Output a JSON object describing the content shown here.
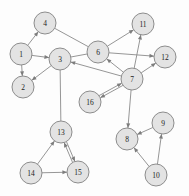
{
  "graph": {
    "title": "directed-graph",
    "background_color": "#fdfdfd",
    "node_fill_color": "#e3e3e3",
    "node_stroke_color": "#8d8d8d",
    "edge_color": "#8a8a8a",
    "label_color": "#1c1c1c",
    "node_radius": 11,
    "nodes": [
      {
        "id": "1",
        "label": "1",
        "x": 21,
        "y": 54
      },
      {
        "id": "2",
        "label": "2",
        "x": 23,
        "y": 87
      },
      {
        "id": "3",
        "label": "3",
        "x": 60,
        "y": 59
      },
      {
        "id": "4",
        "label": "4",
        "x": 45,
        "y": 23
      },
      {
        "id": "5",
        "label": "6",
        "x": 98,
        "y": 52
      },
      {
        "id": "6",
        "label": "7",
        "x": 132,
        "y": 79
      },
      {
        "id": "7",
        "label": "11",
        "x": 143,
        "y": 24
      },
      {
        "id": "8",
        "label": "12",
        "x": 165,
        "y": 57
      },
      {
        "id": "9",
        "label": "16",
        "x": 90,
        "y": 102
      },
      {
        "id": "10",
        "label": "13",
        "x": 61,
        "y": 132
      },
      {
        "id": "11",
        "label": "14",
        "x": 31,
        "y": 173
      },
      {
        "id": "12",
        "label": "15",
        "x": 78,
        "y": 172
      },
      {
        "id": "13",
        "label": "8",
        "x": 127,
        "y": 139
      },
      {
        "id": "14",
        "label": "9",
        "x": 163,
        "y": 123
      },
      {
        "id": "15",
        "label": "10",
        "x": 156,
        "y": 175
      }
    ],
    "edges": [
      {
        "from": "1",
        "to": "4",
        "arrow": "to",
        "double": false
      },
      {
        "from": "1",
        "to": "2",
        "arrow": "to",
        "double": false
      },
      {
        "from": "1",
        "to": "3",
        "arrow": "to",
        "double": false
      },
      {
        "from": "3",
        "to": "2",
        "arrow": "to",
        "double": false
      },
      {
        "from": "3",
        "to": "5",
        "arrow": "none",
        "double": false
      },
      {
        "from": "4",
        "to": "5",
        "arrow": "none",
        "double": false
      },
      {
        "from": "6",
        "to": "3",
        "arrow": "to",
        "double": false
      },
      {
        "from": "3",
        "to": "10",
        "arrow": "none",
        "double": false
      },
      {
        "from": "5",
        "to": "7",
        "arrow": "to",
        "double": false
      },
      {
        "from": "5",
        "to": "8",
        "arrow": "to",
        "double": false
      },
      {
        "from": "6",
        "to": "7",
        "arrow": "to",
        "double": false
      },
      {
        "from": "6",
        "to": "8",
        "arrow": "to",
        "double": false
      },
      {
        "from": "6",
        "to": "5",
        "arrow": "to",
        "double": false
      },
      {
        "from": "9",
        "to": "6",
        "arrow": "both",
        "double": true
      },
      {
        "from": "6",
        "to": "13",
        "arrow": "to",
        "double": false
      },
      {
        "from": "10",
        "to": "11",
        "arrow": "from",
        "double": false
      },
      {
        "from": "10",
        "to": "12",
        "arrow": "both",
        "double": true
      },
      {
        "from": "11",
        "to": "12",
        "arrow": "to",
        "double": false
      },
      {
        "from": "14",
        "to": "13",
        "arrow": "to",
        "double": false
      },
      {
        "from": "15",
        "to": "13",
        "arrow": "to",
        "double": false
      },
      {
        "from": "15",
        "to": "14",
        "arrow": "to",
        "double": false
      }
    ]
  }
}
